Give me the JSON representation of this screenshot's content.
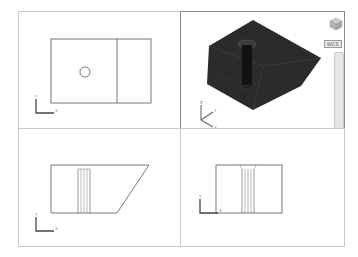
{
  "layout": {
    "viewports": [
      {
        "id": "top",
        "position": "top-left",
        "view": "Top",
        "active": false,
        "ucs": {
          "x_label": "X",
          "y_label": "Y"
        }
      },
      {
        "id": "iso",
        "position": "top-right",
        "view": "SE Isometric",
        "active": true,
        "ucs": {
          "x_label": "X",
          "y_label": "Y",
          "z_label": "Z"
        }
      },
      {
        "id": "front",
        "position": "bottom-left",
        "view": "Front",
        "active": false,
        "ucs": {
          "x_label": "X",
          "y_label": "Y"
        }
      },
      {
        "id": "right",
        "position": "bottom-right",
        "view": "Right",
        "active": false,
        "ucs": {
          "x_label": "X",
          "y_label": "Y"
        }
      }
    ]
  },
  "viewcube": {
    "wcs_label": "WCS"
  },
  "colors": {
    "border": "#c8c8c8",
    "active_border": "#8a8a8a",
    "model_shaded": "#2b2b2b",
    "line": "#555555",
    "ucs": "#444444"
  }
}
